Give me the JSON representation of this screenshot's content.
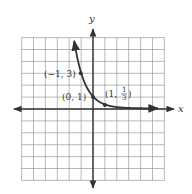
{
  "chart_data": {
    "type": "line",
    "title": "",
    "function": "y = (1/3)^x",
    "xlabel": "x",
    "ylabel": "y",
    "xlim": [
      -6,
      6
    ],
    "ylim": [
      -6,
      6
    ],
    "grid": true,
    "grid_step": 1,
    "series": [
      {
        "name": "exponential decay curve",
        "x": [
          -1.55,
          -1,
          -0.5,
          0,
          0.5,
          1,
          2,
          3,
          4,
          5.5
        ],
        "y": [
          5.5,
          3,
          1.732,
          1,
          0.577,
          0.333,
          0.111,
          0.037,
          0.012,
          0.002
        ]
      }
    ],
    "points": [
      {
        "x": -1,
        "y": 3,
        "label": "(−1, 3)"
      },
      {
        "x": 0,
        "y": 1,
        "label": "(0, 1)"
      },
      {
        "x": 1,
        "y": 0.3333,
        "label_prefix": "(1, ",
        "label_num": "1",
        "label_den": "3",
        "label_suffix": ")"
      }
    ],
    "legend": "none"
  },
  "labels": {
    "x_axis": "x",
    "y_axis": "y",
    "p1": "(−1, 3)",
    "p2": "(0, 1)",
    "p3_prefix": "(1, ",
    "p3_num": "1",
    "p3_den": "3",
    "p3_suffix": ")"
  },
  "colors": {
    "ink": "#333333",
    "grid": "#8a8a8a",
    "background": "#ffffff"
  }
}
